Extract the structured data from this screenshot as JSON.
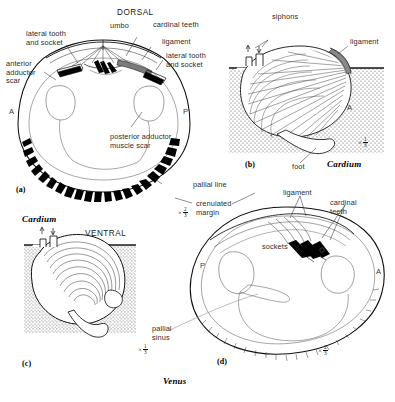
{
  "figure": {
    "caption_genus_lower": "Venus",
    "ink_color": "#111111",
    "sediment_color": "#555555",
    "background": "#ffffff"
  },
  "panels": [
    {
      "id": "a",
      "tag": "(a)",
      "subject": "Venus",
      "view": "interior of right valve",
      "scale_prefix": "×",
      "scale_num": "2",
      "scale_den": "3",
      "orientation": {
        "anterior": "A",
        "posterior": "P",
        "dorsal": "DORSAL",
        "ventral": "VENTRAL"
      },
      "labels": [
        "lateral tooth\nand socket",
        "anterior\nadductor\nscar",
        "DORSAL",
        "umbo",
        "cardinal teeth",
        "ligament",
        "lateral tooth\nand socket",
        "posterior adductor\nmuscle scar",
        "pallial line",
        "crenulated\nmargin"
      ]
    },
    {
      "id": "b",
      "tag": "(b)",
      "subject": "Cardium",
      "view": "life position in sediment",
      "scale_prefix": "×",
      "scale_num": "1",
      "scale_den": "3",
      "orientation": {
        "anterior": "A"
      },
      "labels": [
        "siphons",
        "ligament",
        "foot"
      ]
    },
    {
      "id": "c",
      "tag": "(c)",
      "subject": "Cardium",
      "view": "shallow burrower in sediment",
      "scale_prefix": "×",
      "scale_num": "1",
      "scale_den": "3",
      "orientation": {
        "ventral": "VENTRAL"
      },
      "labels": [
        "Cardium",
        "VENTRAL"
      ]
    },
    {
      "id": "d",
      "tag": "(d)",
      "subject": "Venus",
      "view": "interior of left valve",
      "scale_prefix": "×",
      "scale_num": "2",
      "scale_den": "3",
      "orientation": {
        "anterior": "A",
        "posterior": "P"
      },
      "labels": [
        "ligament",
        "cardinal teeth",
        "sockets",
        "pallial sinus"
      ]
    }
  ],
  "annotations": {
    "a_lateral_tooth_left": "lateral tooth\nand socket",
    "a_anterior_adductor": "anterior\nadductor\nscar",
    "a_dorsal": "DORSAL",
    "a_umbo": "umbo",
    "a_cardinal_teeth": "cardinal teeth",
    "a_ligament": "ligament",
    "a_lateral_tooth_right": "lateral tooth\nand socket",
    "a_posterior_adductor": "posterior adductor\nmuscle scar",
    "a_pallial_line": "pallial line",
    "a_crenulated_margin": "crenulated\nmargin",
    "a_anterior_mark": "A",
    "a_posterior_mark": "P",
    "a_tag": "(a)",
    "b_siphons": "siphons",
    "b_ligament": "ligament",
    "b_foot": "foot",
    "b_anterior_mark": "A",
    "b_genus": "Cardium",
    "b_tag": "(b)",
    "c_genus": "Cardium",
    "c_ventral": "VENTRAL",
    "c_tag": "(c)",
    "d_ligament": "ligament",
    "d_cardinal_teeth": "cardinal\nteeth",
    "d_sockets": "sockets",
    "d_pallial_sinus": "pallial\nsinus",
    "d_anterior_mark": "A",
    "d_posterior_mark": "P",
    "d_tag": "(d)",
    "plate_genus": "Venus"
  }
}
